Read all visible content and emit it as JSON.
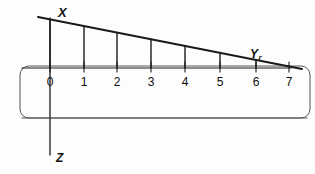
{
  "figure": {
    "background_color": "#fdfdfd",
    "stroke_color": "#1a1a1a",
    "bracket_color": "#555555",
    "width": 315,
    "height": 174
  },
  "axes": {
    "vertical_axis": {
      "name": "X-Z vertical axis",
      "top_label": "X",
      "bottom_label": "Z",
      "x": 50,
      "y_top": 18,
      "y_bottom": 155
    },
    "horizontal_axis": {
      "name": "horizontal number line",
      "label": "Yr",
      "label_base": "Y",
      "label_subscript": "r",
      "y": 68,
      "x_start": 22,
      "x_end": 291
    }
  },
  "scale": {
    "tick_labels": [
      "0",
      "1",
      "2",
      "3",
      "4",
      "5",
      "6",
      "7"
    ],
    "tick_positions_px": [
      50,
      84,
      117,
      151,
      185,
      220,
      256,
      289
    ],
    "tick_label_y": 76,
    "minor_tick_top_y": 62,
    "minor_tick_bottom_y": 72
  },
  "sloped_line": {
    "name": "declining diagonal line",
    "x1": 38,
    "y1": 17,
    "x2": 302,
    "y2": 69,
    "description": "straight line sloping downward from upper-left to lower-right, crossing the horizontal axis near tick 6"
  },
  "vertical_drops": {
    "name": "ordinate drop lines from sloped line to axis",
    "count": 7,
    "x_positions": [
      50,
      84,
      117,
      151,
      185,
      220,
      256
    ],
    "bottom_y": 68
  },
  "bracket": {
    "name": "rounded rectangle bracket",
    "x": 20,
    "y": 66,
    "width": 290,
    "height": 52,
    "corner_radius": 9
  },
  "bottom_line": {
    "name": "lower horizontal rule",
    "y": 118,
    "x_start": 22,
    "x_end": 307
  }
}
